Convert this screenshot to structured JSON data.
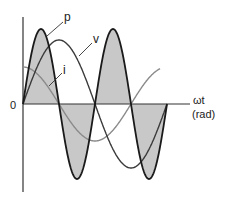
{
  "diagram": {
    "origin_label": "0",
    "x_axis_label": "ωt",
    "x_axis_unit": "(rad)",
    "curves": [
      {
        "id": "p",
        "label": "p",
        "description": "instantaneous power",
        "color": "#1a1a1a",
        "fill": "#c8c8c8",
        "amplitude_px": 75,
        "form": "sin(2ωt)"
      },
      {
        "id": "v",
        "label": "v",
        "description": "voltage",
        "color": "#3a3a3a",
        "amplitude_px": 64,
        "form": "sin(ωt)"
      },
      {
        "id": "i",
        "label": "i",
        "description": "current",
        "color": "#8a8a8a",
        "amplitude_px": 37,
        "form": "cos(ωt)"
      }
    ],
    "colors": {
      "axis": "#333333",
      "power_fill": "#c8c8c8",
      "power_stroke": "#1a1a1a",
      "voltage": "#3a3a3a",
      "current": "#8a8a8a"
    }
  }
}
